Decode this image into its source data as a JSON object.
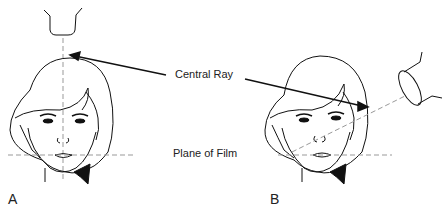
{
  "labels": {
    "central_ray": "Central Ray",
    "plane_of_film": "Plane of Film",
    "panel_a": "A",
    "panel_b": "B"
  },
  "panels": [
    {
      "id": "A",
      "description": "Tube directly above head, central ray vertical (perpendicular to film plane)"
    },
    {
      "id": "B",
      "description": "Tube angled to the right, central ray oblique through face"
    }
  ],
  "colors": {
    "line": "#111111",
    "dashed": "#999999",
    "text": "#222222"
  }
}
